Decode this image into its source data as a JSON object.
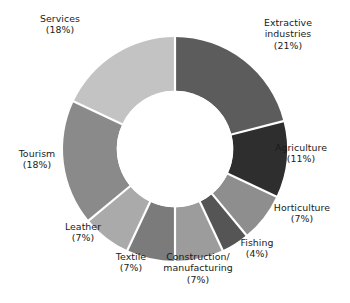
{
  "chart_data": {
    "type": "pie",
    "variant": "donut",
    "title": "",
    "subtitle": "",
    "xlabel": "",
    "ylabel": "",
    "legend": "none",
    "grid": false,
    "units": "percent",
    "total": 100,
    "start_angle_deg": 0,
    "direction": "clockwise",
    "inner_radius_ratio": 0.52,
    "separator_color": "#ffffff",
    "background": "#ffffff",
    "categories": [
      "Extractive industries",
      "Agriculture",
      "Horticulture",
      "Fishing",
      "Construction/ manufacturing",
      "Textile",
      "Leather",
      "Tourism",
      "Services"
    ],
    "values": [
      21,
      11,
      7,
      4,
      7,
      7,
      7,
      18,
      18
    ],
    "colors": [
      "#5c5c5c",
      "#2e2e2e",
      "#8e8e8e",
      "#555555",
      "#9c9c9c",
      "#7b7b7b",
      "#aaaaaa",
      "#8a8a8a",
      "#c3c3c3"
    ],
    "slices": [
      {
        "label": "Extractive industries",
        "label_line1": "Extractive",
        "label_line2": "industries",
        "value": 21,
        "value_text": "(21%)",
        "color": "#5c5c5c"
      },
      {
        "label": "Agriculture",
        "label_line1": "Agriculture",
        "label_line2": "",
        "value": 11,
        "value_text": "(11%)",
        "color": "#2e2e2e"
      },
      {
        "label": "Horticulture",
        "label_line1": "Horticulture",
        "label_line2": "",
        "value": 7,
        "value_text": "(7%)",
        "color": "#8e8e8e"
      },
      {
        "label": "Fishing",
        "label_line1": "Fishing",
        "label_line2": "",
        "value": 4,
        "value_text": "(4%)",
        "color": "#555555"
      },
      {
        "label": "Construction/ manufacturing",
        "label_line1": "Construction/",
        "label_line2": "manufacturing",
        "value": 7,
        "value_text": "(7%)",
        "color": "#9c9c9c"
      },
      {
        "label": "Textile",
        "label_line1": "Textile",
        "label_line2": "",
        "value": 7,
        "value_text": "(7%)",
        "color": "#7b7b7b"
      },
      {
        "label": "Leather",
        "label_line1": "Leather",
        "label_line2": "",
        "value": 7,
        "value_text": "(7%)",
        "color": "#aaaaaa"
      },
      {
        "label": "Tourism",
        "label_line1": "Tourism",
        "label_line2": "",
        "value": 18,
        "value_text": "(18%)",
        "color": "#8a8a8a"
      },
      {
        "label": "Services",
        "label_line1": "Services",
        "label_line2": "",
        "value": 18,
        "value_text": "(18%)",
        "color": "#c3c3c3"
      }
    ]
  },
  "labels": {
    "services": {
      "name": "Services",
      "pct": "(18%)"
    },
    "extractive": {
      "l1": "Extractive",
      "l2": "industries",
      "pct": "(21%)"
    },
    "agriculture": {
      "name": "Agriculture",
      "pct": "(11%)"
    },
    "horticulture": {
      "name": "Horticulture",
      "pct": "(7%)"
    },
    "fishing": {
      "name": "Fishing",
      "pct": "(4%)"
    },
    "construction": {
      "l1": "Construction/",
      "l2": "manufacturing",
      "pct": "(7%)"
    },
    "textile": {
      "name": "Textile",
      "pct": "(7%)"
    },
    "leather": {
      "name": "Leather",
      "pct": "(7%)"
    },
    "tourism": {
      "name": "Tourism",
      "pct": "(18%)"
    }
  }
}
